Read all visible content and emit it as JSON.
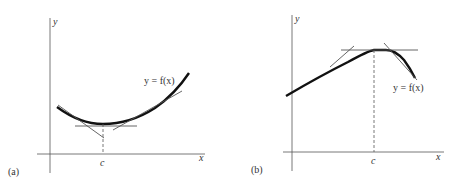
{
  "panel_a": {
    "label": "(a)",
    "y_axis_label": "y",
    "x_axis_label": "x",
    "point_label": "c",
    "curve_label": "y = f(x)",
    "description": "Convex curve with minimum at x = c; horizontal tangent at the minimum, secant/tangent lines on both sides"
  },
  "panel_b": {
    "label": "(b)",
    "y_axis_label": "y",
    "x_axis_label": "x",
    "point_label": "c",
    "curve_label": "y = f(x)",
    "description": "Curve with maximum at x = c; horizontal tangent at the maximum, tangent lines on both sides"
  },
  "colors": {
    "curve": "#111111",
    "axis": "#444444",
    "tangent": "#555555"
  }
}
